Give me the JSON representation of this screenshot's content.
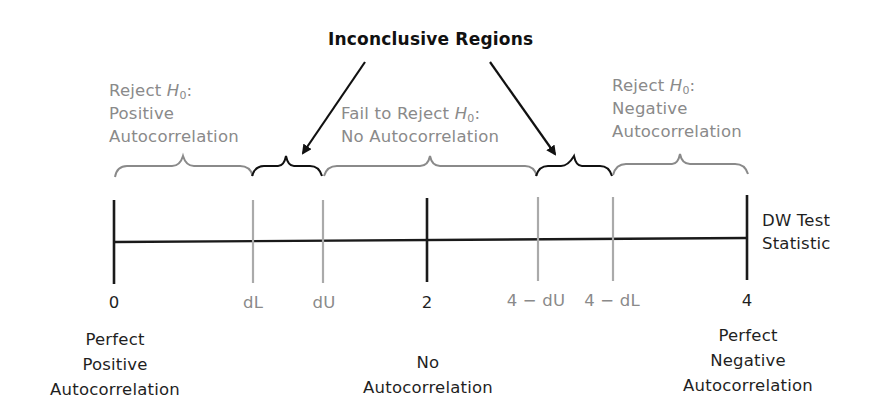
{
  "title": "Inconclusive Regions",
  "axis": {
    "label_line1": "DW Test",
    "label_line2": "Statistic",
    "ticks": [
      {
        "label": "0",
        "kind": "major"
      },
      {
        "label": "dL",
        "kind": "minor"
      },
      {
        "label": "dU",
        "kind": "minor"
      },
      {
        "label": "2",
        "kind": "major"
      },
      {
        "label": "4 − dU",
        "kind": "minor"
      },
      {
        "label": "4 − dL",
        "kind": "minor"
      },
      {
        "label": "4",
        "kind": "major"
      }
    ]
  },
  "regions": {
    "positive": {
      "l1_pre": "Reject ",
      "h": "H",
      "sub": "0",
      "colon": ":",
      "l2": "Positive",
      "l3": "Autocorrelation"
    },
    "none": {
      "l1_pre": "Fail to Reject ",
      "h": "H",
      "sub": "0",
      "colon": ":",
      "l2": "No Autocorrelation"
    },
    "negative": {
      "l1_pre": "Reject ",
      "h": "H",
      "sub": "0",
      "colon": ":",
      "l2": "Negative",
      "l3": "Autocorrelation"
    }
  },
  "bottom_labels": {
    "left": [
      "Perfect",
      "Positive",
      "Autocorrelation"
    ],
    "center": [
      "No",
      "Autocorrelation"
    ],
    "right": [
      "Perfect",
      "Negative",
      "Autocorrelation"
    ]
  },
  "colors": {
    "gray": "#8a8a8a",
    "black": "#1a1a1a"
  }
}
